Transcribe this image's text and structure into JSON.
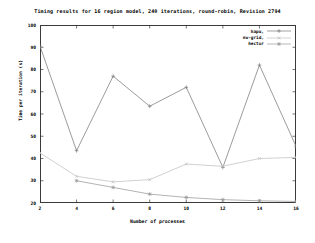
{
  "chart_data": {
    "type": "line",
    "title": "Timing results for 16 region model, 240 iterations, round-robin, Revision 2794",
    "xlabel": "Number of processes",
    "ylabel": "Time per iteration (s)",
    "x": [
      2,
      4,
      6,
      8,
      10,
      12,
      14,
      16
    ],
    "xlim": [
      2,
      16
    ],
    "ylim": [
      20,
      100
    ],
    "xticks": [
      "2",
      "4",
      "6",
      "8",
      "10",
      "12",
      "14",
      "16"
    ],
    "yticks": [
      "100",
      "90",
      "80",
      "70",
      "60",
      "50",
      "40",
      "30",
      "20"
    ],
    "grid": false,
    "legend_position": "top-right",
    "series": [
      {
        "name": "hapu,",
        "color": "#7a7a7a",
        "marker": "plus",
        "values": [
          90.5,
          43.5,
          77.0,
          63.5,
          72.0,
          36.0,
          82.0,
          45.5
        ]
      },
      {
        "name": "nw-grid,",
        "color": "#c0c0c0",
        "marker": "cross",
        "values": [
          42.5,
          32.0,
          29.5,
          30.5,
          37.5,
          36.5,
          40.0,
          40.5
        ]
      },
      {
        "name": "hector",
        "color": "#9a9a9a",
        "marker": "star",
        "values": [
          null,
          30.0,
          27.0,
          24.0,
          22.5,
          21.5,
          21.0,
          20.7
        ]
      }
    ]
  }
}
